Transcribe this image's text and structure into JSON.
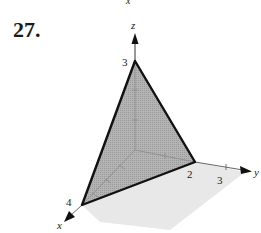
{
  "problem": {
    "number": "27."
  },
  "top_cut_label": "x",
  "figure": {
    "type": "3d-plane-first-octant",
    "axes": {
      "x": {
        "label": "x",
        "tick_label": "4"
      },
      "y": {
        "label": "y",
        "tick_labels": [
          "2",
          "3"
        ]
      },
      "z": {
        "label": "z",
        "tick_label": "3"
      }
    },
    "intercepts": {
      "x": 4,
      "y": 2,
      "z": 3
    },
    "colors": {
      "plane_fill": "#a9a9a9",
      "ground_fill": "#e6e6e6",
      "edge": "#111111",
      "axis": "#777777"
    }
  }
}
